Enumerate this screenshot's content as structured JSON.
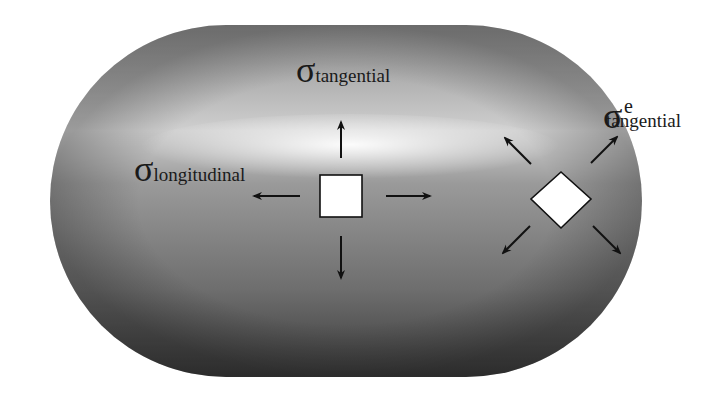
{
  "diagram": {
    "colors": {
      "background": "#ffffff",
      "capsule_dark": "#3c3c3c",
      "capsule_mid": "#8a8a8a",
      "capsule_highlight": "#f4f4f4",
      "element_fill": "#ffffff",
      "stroke": "#111111"
    },
    "labels": {
      "tangential": {
        "symbol": "σ",
        "subscript": "tangential"
      },
      "longitudinal": {
        "symbol": "σ",
        "subscript": "longitudinal"
      },
      "end_tangential": {
        "symbol": "σ",
        "superscript": "e",
        "subscript": "tangential"
      }
    },
    "elements": [
      {
        "name": "cylinder-stress-element",
        "shape": "square",
        "arrows": [
          "up",
          "down",
          "left",
          "right"
        ]
      },
      {
        "name": "end-cap-stress-element",
        "shape": "diamond",
        "arrows": [
          "up-left",
          "up-right",
          "down-left",
          "down-right"
        ]
      }
    ]
  }
}
